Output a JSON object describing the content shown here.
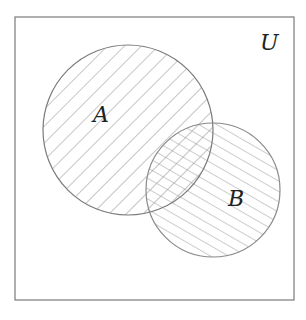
{
  "diagram": {
    "type": "venn",
    "universe": {
      "label": "U",
      "x": 15,
      "y": 17,
      "width": 279,
      "height": 283
    },
    "sets": [
      {
        "id": "A",
        "label": "A",
        "cx": 128,
        "cy": 130,
        "r": 85,
        "hatch": "diagonal-down",
        "label_x": 94,
        "label_y": 122
      },
      {
        "id": "B",
        "label": "B",
        "cx": 213,
        "cy": 190,
        "r": 67,
        "hatch": "diagonal-up-shallow",
        "label_x": 229,
        "label_y": 206
      }
    ],
    "labels": {
      "universe": "U",
      "set_a": "A",
      "set_b": "B"
    },
    "colors": {
      "stroke": "#7a7a7a",
      "hatch": "#8c8c8c",
      "text": "#222222",
      "background": "#ffffff"
    }
  }
}
